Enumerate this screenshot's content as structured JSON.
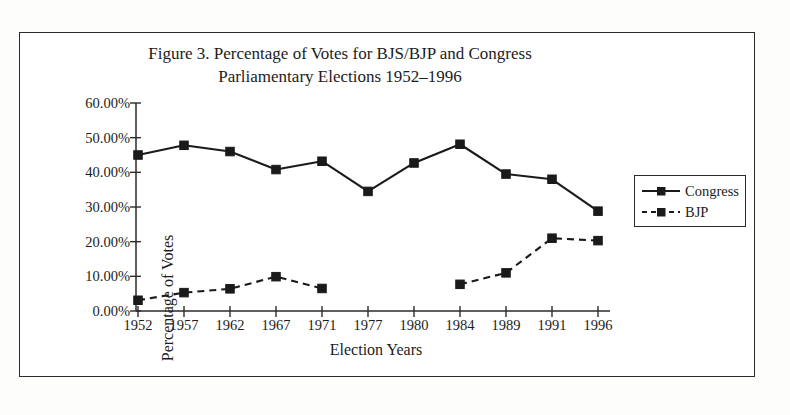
{
  "figure": {
    "title": "Figure 3. Percentage of Votes for BJS/BJP and Congress\nParliamentary Elections 1952–1996"
  },
  "legend": {
    "position": "right",
    "entries": [
      {
        "label": "Congress",
        "style": "solid",
        "marker": "square"
      },
      {
        "label": "BJP",
        "style": "dashed",
        "marker": "square"
      }
    ]
  },
  "axes": {
    "x_title": "Election Years",
    "y_title": "Percentage of Votes",
    "y_ticks": [
      "0.00%",
      "10.00%",
      "20.00%",
      "30.00%",
      "40.00%",
      "50.00%",
      "60.00%"
    ]
  },
  "chart_data": {
    "type": "line",
    "title": "Figure 3. Percentage of Votes for BJS/BJP and Congress Parliamentary Elections 1952–1996",
    "xlabel": "Election Years",
    "ylabel": "Percentage of Votes",
    "categories": [
      "1952",
      "1957",
      "1962",
      "1967",
      "1971",
      "1977",
      "1980",
      "1984",
      "1989",
      "1991",
      "1996"
    ],
    "ylim": [
      0,
      60
    ],
    "ytick_values": [
      0,
      10,
      20,
      30,
      40,
      50,
      60
    ],
    "ytick_labels": [
      "0.00%",
      "10.00%",
      "20.00%",
      "30.00%",
      "40.00%",
      "50.00%",
      "60.00%"
    ],
    "grid": false,
    "legend_position": "right",
    "series": [
      {
        "name": "Congress",
        "line_style": "solid",
        "marker": "square",
        "color": "#1a1a1a",
        "values": [
          45.0,
          47.8,
          46.0,
          40.8,
          43.2,
          34.5,
          42.7,
          48.1,
          39.5,
          38.0,
          28.8
        ]
      },
      {
        "name": "BJP",
        "line_style": "dashed",
        "marker": "square",
        "color": "#1a1a1a",
        "values": [
          3.1,
          5.3,
          6.4,
          9.9,
          6.5,
          null,
          null,
          7.7,
          11.0,
          21.0,
          20.3
        ]
      }
    ]
  }
}
